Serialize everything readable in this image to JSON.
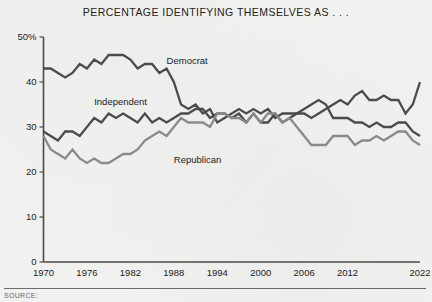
{
  "chart_data": {
    "type": "line",
    "title": "PERCENTAGE IDENTIFYING THEMSELVES AS . . .",
    "xlabel": "",
    "ylabel": "",
    "xlim": [
      1970,
      2022
    ],
    "ylim": [
      0,
      50
    ],
    "grid": false,
    "legend_position": "inline-annotations",
    "ytick_labels": [
      "50%",
      "40",
      "30",
      "20",
      "10",
      "0"
    ],
    "ytick_values": [
      50,
      40,
      30,
      20,
      10,
      0
    ],
    "xtick_labels": [
      "1970",
      "1976",
      "1982",
      "1988",
      "1994",
      "2000",
      "2006",
      "2012",
      "2022"
    ],
    "xtick_values": [
      1970,
      1976,
      1982,
      1988,
      1994,
      2000,
      2006,
      2012,
      2022
    ],
    "x": [
      1970,
      1971,
      1972,
      1973,
      1974,
      1975,
      1976,
      1977,
      1978,
      1979,
      1980,
      1981,
      1982,
      1983,
      1984,
      1985,
      1986,
      1987,
      1988,
      1989,
      1990,
      1991,
      1992,
      1993,
      1994,
      1995,
      1996,
      1997,
      1998,
      1999,
      2000,
      2001,
      2002,
      2003,
      2004,
      2005,
      2006,
      2007,
      2008,
      2009,
      2010,
      2011,
      2012,
      2013,
      2014,
      2015,
      2016,
      2017,
      2018,
      2019,
      2020,
      2021,
      2022
    ],
    "series": [
      {
        "name": "Democrat",
        "color": "#4b4b4b",
        "label_x": 1987,
        "label_y": 44,
        "values": [
          43,
          43,
          42,
          41,
          42,
          44,
          43,
          45,
          44,
          46,
          46,
          46,
          45,
          43,
          44,
          44,
          42,
          43,
          40,
          35,
          34,
          35,
          33,
          34,
          31,
          32,
          33,
          34,
          33,
          34,
          33,
          34,
          32,
          33,
          33,
          33,
          34,
          35,
          36,
          35,
          32,
          32,
          32,
          31,
          31,
          30,
          31,
          30,
          30,
          31,
          31,
          29,
          28
        ]
      },
      {
        "name": "Independent",
        "color": "#4b4b4b",
        "label_x": 1977,
        "label_y": 35,
        "values": [
          29,
          28,
          27,
          29,
          29,
          28,
          30,
          32,
          31,
          33,
          32,
          33,
          32,
          31,
          33,
          31,
          32,
          31,
          32,
          33,
          33,
          34,
          34,
          32,
          33,
          33,
          32,
          33,
          31,
          33,
          31,
          31,
          33,
          31,
          32,
          33,
          33,
          32,
          33,
          34,
          35,
          36,
          35,
          37,
          38,
          36,
          36,
          37,
          36,
          36,
          33,
          35,
          40
        ]
      },
      {
        "name": "Republican",
        "color": "#8a8a8a",
        "label_x": 1988,
        "label_y": 22,
        "values": [
          28,
          25,
          24,
          23,
          25,
          23,
          22,
          23,
          22,
          22,
          23,
          24,
          24,
          25,
          27,
          28,
          29,
          28,
          30,
          32,
          31,
          31,
          31,
          30,
          33,
          33,
          32,
          32,
          31,
          33,
          31,
          33,
          33,
          31,
          32,
          30,
          28,
          26,
          26,
          26,
          28,
          28,
          28,
          26,
          27,
          27,
          28,
          27,
          28,
          29,
          29,
          27,
          26
        ]
      }
    ]
  },
  "footer": {
    "source_note": "SOURCE:"
  }
}
